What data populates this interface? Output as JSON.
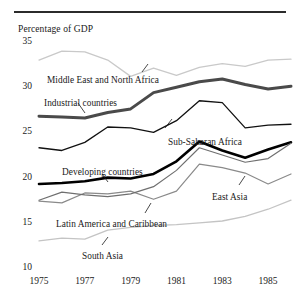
{
  "figure": {
    "axis_title": "Percentage of GDP",
    "has_top_rule": true
  },
  "chart_data": {
    "type": "line",
    "title": "",
    "subtitle": "",
    "xlabel": "",
    "ylabel": "Percentage of GDP",
    "xlim": [
      1975,
      1986
    ],
    "ylim": [
      10,
      35
    ],
    "grid": false,
    "legend": "inline-labels",
    "x": [
      1975,
      1976,
      1977,
      1978,
      1979,
      1980,
      1981,
      1982,
      1983,
      1984,
      1985,
      1986
    ],
    "xticks": [
      "1975",
      "1977",
      "1979",
      "1981",
      "1983",
      "1985"
    ],
    "xtick_values": [
      1975,
      1977,
      1979,
      1981,
      1983,
      1985
    ],
    "yticks": [
      "35",
      "30",
      "25",
      "20",
      "15",
      "10"
    ],
    "ytick_values": [
      35,
      30,
      25,
      20,
      15,
      10
    ],
    "series": [
      {
        "name": "Middle East and North Africa",
        "color": "#c9c9c9",
        "width": 1.3,
        "values": [
          33.0,
          34.0,
          33.9,
          33.0,
          31.2,
          32.1,
          31.3,
          32.2,
          32.6,
          32.3,
          33.0,
          33.1
        ],
        "label_x": 47,
        "label_y": 75,
        "leader": {
          "x1": 142,
          "y1": 72,
          "x2": 148,
          "y2": 64
        }
      },
      {
        "name": "Industrial countries",
        "color": "#4a4a4a",
        "width": 3.0,
        "values": [
          26.8,
          26.7,
          26.6,
          27.2,
          27.6,
          29.4,
          30.0,
          30.6,
          30.9,
          30.3,
          29.8,
          30.1
        ],
        "label_x": 44,
        "label_y": 98,
        "leader": {
          "x1": 78,
          "y1": 103,
          "x2": 85,
          "y2": 113
        }
      },
      {
        "name": "Sub-Saharan Africa",
        "color": "#111111",
        "width": 1.3,
        "values": [
          23.3,
          23.0,
          23.9,
          25.6,
          25.5,
          25.0,
          26.3,
          28.5,
          28.3,
          25.5,
          25.8,
          25.9
        ],
        "label_x": 168,
        "label_y": 137,
        "leader": {
          "x1": 165,
          "y1": 128,
          "x2": 172,
          "y2": 119
        }
      },
      {
        "name": "Developing countries",
        "color": "#000000",
        "width": 2.6,
        "values": [
          19.3,
          19.4,
          19.6,
          20.0,
          19.9,
          20.4,
          21.8,
          24.0,
          23.0,
          22.2,
          23.1,
          23.9
        ],
        "label_x": 62,
        "label_y": 167,
        "leader": {
          "x1": 102,
          "y1": 174,
          "x2": 108,
          "y2": 182
        }
      },
      {
        "name": "Latin America and Caribbean",
        "color": "#8a8a8a",
        "width": 1.2,
        "values": [
          17.4,
          17.2,
          18.3,
          18.2,
          18.5,
          17.6,
          18.5,
          21.5,
          21.1,
          20.5,
          19.3,
          20.4
        ],
        "label_x": 56,
        "label_y": 219,
        "leader": {
          "x1": 145,
          "y1": 213,
          "x2": 151,
          "y2": 203
        }
      },
      {
        "name": "East Asia",
        "color": "#6f6f6f",
        "width": 1.2,
        "values": [
          17.5,
          18.4,
          18.1,
          17.9,
          18.2,
          19.0,
          20.8,
          23.3,
          22.5,
          21.7,
          22.1,
          23.8
        ],
        "label_x": 212,
        "label_y": 192,
        "leader": {
          "x1": 239,
          "y1": 185,
          "x2": 245,
          "y2": 176
        }
      },
      {
        "name": "South Asia",
        "color": "#c4c4c4",
        "width": 1.3,
        "values": [
          13.0,
          13.3,
          13.2,
          14.2,
          14.5,
          14.7,
          14.8,
          15.0,
          15.2,
          15.7,
          16.5,
          17.5
        ],
        "label_x": 82,
        "label_y": 251,
        "leader": {
          "x1": 102,
          "y1": 245,
          "x2": 108,
          "y2": 237
        }
      }
    ]
  }
}
